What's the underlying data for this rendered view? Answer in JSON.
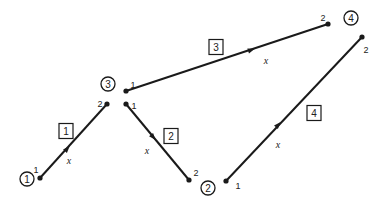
{
  "diagram": {
    "nodes": [
      {
        "id": "1",
        "label": "1",
        "x": 27,
        "y": 179
      },
      {
        "id": "2",
        "label": "2",
        "x": 208,
        "y": 188
      },
      {
        "id": "3",
        "label": "3",
        "x": 108,
        "y": 84
      },
      {
        "id": "4",
        "label": "4",
        "x": 351,
        "y": 18
      }
    ],
    "elements": [
      {
        "id": "1",
        "label": "1",
        "x1": 40,
        "y1": 178,
        "x2": 107,
        "y2": 104,
        "mid": [
          67,
          149
        ],
        "box": [
          66,
          131
        ],
        "xlab": [
          69,
          160
        ],
        "end1_label": "1",
        "end1_pos": [
          36,
          170
        ],
        "end2_label": "2",
        "end2_pos": [
          100,
          104
        ]
      },
      {
        "id": "2",
        "label": "2",
        "x1": 126,
        "y1": 104,
        "x2": 189,
        "y2": 180,
        "mid": [
          153,
          137
        ],
        "box": [
          171,
          136
        ],
        "xlab": [
          147,
          150
        ],
        "end1_label": "1",
        "end1_pos": [
          134,
          106
        ],
        "end2_label": "2",
        "end2_pos": [
          196,
          173
        ]
      },
      {
        "id": "3",
        "label": "3",
        "x1": 126,
        "y1": 91,
        "x2": 328,
        "y2": 24,
        "mid": [
          251,
          50
        ],
        "box": [
          216,
          47
        ],
        "xlab": [
          266,
          60
        ],
        "end1_label": "1",
        "end1_pos": [
          133,
          85
        ],
        "end2_label": "2",
        "end2_pos": [
          323,
          18
        ]
      },
      {
        "id": "4",
        "label": "4",
        "x1": 226,
        "y1": 181,
        "x2": 362,
        "y2": 37,
        "mid": [
          278,
          125
        ],
        "box": [
          314,
          113
        ],
        "xlab": [
          278,
          144
        ],
        "end1_label": "1",
        "end1_pos": [
          238,
          186
        ],
        "end2_label": "2",
        "end2_pos": [
          366,
          50
        ]
      }
    ],
    "local_axis_label": "x",
    "colors": {
      "line": "#1a1a1a",
      "background": "#ffffff"
    }
  }
}
